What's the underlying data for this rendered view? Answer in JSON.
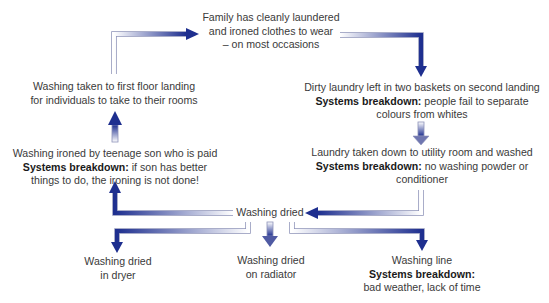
{
  "diagram": {
    "type": "flow-cycle",
    "arrow_color": "#1e2f8f",
    "nodes": {
      "goal": {
        "lines": [
          "Family has cleanly laundered",
          "and ironed clothes to wear",
          "– on most occasions"
        ]
      },
      "dirty": {
        "text": "Dirty laundry left in two baskets on second landing",
        "breakdown_label": "Systems breakdown:",
        "breakdown_text": "people fail to separate",
        "breakdown_text2": "colours from whites"
      },
      "washed": {
        "text": "Laundry taken down to utility room and washed",
        "breakdown_label": "Systems breakdown:",
        "breakdown_text": "no washing powder or",
        "breakdown_text2": "conditioner"
      },
      "dried": {
        "text": "Washing dried"
      },
      "dryer": {
        "lines": [
          "Washing dried",
          "in dryer"
        ]
      },
      "radiator": {
        "lines": [
          "Washing dried",
          "on radiator"
        ]
      },
      "line": {
        "text": "Washing line",
        "breakdown_label": "Systems breakdown:",
        "breakdown_text": "bad weather, lack of time"
      },
      "ironed": {
        "text": "Washing ironed by teenage son who is paid",
        "breakdown_label": "Systems breakdown:",
        "breakdown_text": "if son has better",
        "breakdown_text2": "things to do, the ironing is not done!"
      },
      "landing": {
        "lines": [
          "Washing taken to first floor landing",
          "for individuals to take to their rooms"
        ]
      }
    }
  }
}
